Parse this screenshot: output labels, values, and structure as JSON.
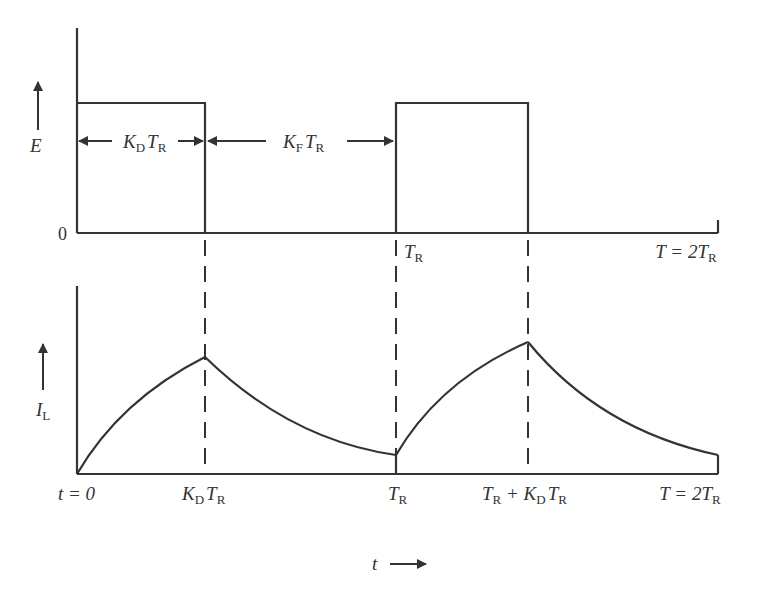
{
  "diagram": {
    "top_panel": {
      "y_axis_label": "E",
      "zero_label": "0",
      "span_labels": [
        {
          "main": "K",
          "sub1": "D",
          "main2": "T",
          "sub2": "R"
        },
        {
          "main": "K",
          "sub1": "F",
          "main2": "T",
          "sub2": "R"
        }
      ],
      "x_labels": [
        {
          "main": "T",
          "sub": "R"
        },
        {
          "prefix": "T = 2T",
          "sub": "R"
        }
      ]
    },
    "bottom_panel": {
      "y_axis_label": "I",
      "y_axis_sub": "L",
      "x_labels": [
        {
          "text": "t = 0"
        },
        {
          "main": "K",
          "sub1": "D",
          "main2": "T",
          "sub2": "R"
        },
        {
          "main": "T",
          "sub": "R"
        },
        {
          "main": "T",
          "sub1": "R",
          "mid": " + K",
          "sub2": "D",
          "main3": "T",
          "sub3": "R"
        },
        {
          "prefix": "T = 2T",
          "sub": "R"
        }
      ]
    },
    "time_axis_label": "t",
    "colors": {
      "stroke": "#333333",
      "background": "#ffffff"
    }
  }
}
